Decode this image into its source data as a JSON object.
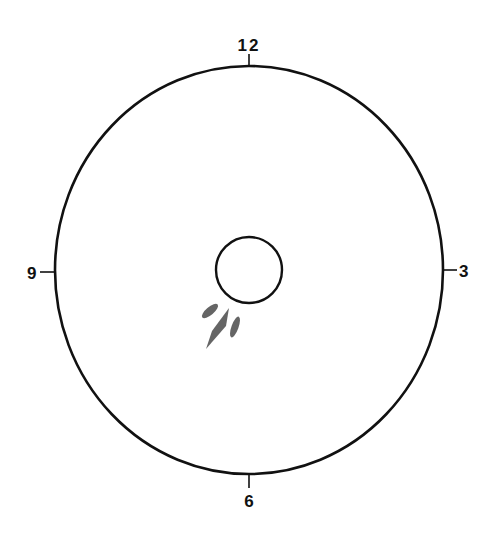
{
  "diagram": {
    "type": "clock-face target / impact pattern",
    "colors": {
      "stroke": "#111111",
      "marks": "#555555",
      "background": "#ffffff"
    },
    "outer_ring": {
      "cx": 249,
      "cy": 270,
      "rx": 194,
      "ry": 204
    },
    "center_circle": {
      "cx": 249,
      "cy": 270,
      "r": 33
    },
    "clock_labels": {
      "top": "12",
      "right": "3",
      "bottom": "6",
      "left": "9"
    },
    "marks": [
      {
        "name": "upper-left streak",
        "position": "between 7 and 8 o'clock, near center"
      },
      {
        "name": "main diamond streak",
        "position": "7 o'clock, below-left of center"
      },
      {
        "name": "right thin streak",
        "position": "7 o'clock, right of main streak"
      }
    ]
  }
}
